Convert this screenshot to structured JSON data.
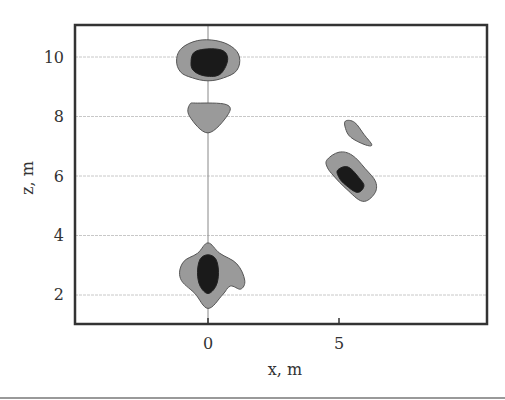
{
  "chart_data": {
    "type": "contour",
    "title": "",
    "xlabel": "x, m",
    "ylabel": "z, m",
    "xlim": [
      -5.1,
      10.7
    ],
    "ylim": [
      1.0,
      11.1
    ],
    "x_ticks": [
      0,
      5
    ],
    "y_ticks": [
      2,
      4,
      6,
      8,
      10
    ],
    "x_tick_labels": [
      "0",
      "5"
    ],
    "y_tick_labels": [
      "2",
      "4",
      "6",
      "8",
      "10"
    ],
    "grid": {
      "horizontal": true,
      "style": "dashed light gray"
    },
    "reference_line": {
      "orientation": "vertical",
      "x": 0
    },
    "legend": null,
    "levels": [
      {
        "name": "outer",
        "color": "#9a9a9a"
      },
      {
        "name": "inner",
        "color": "#1a1a1a"
      }
    ],
    "regions": [
      {
        "id": "top-blob",
        "center": [
          0.0,
          9.85
        ],
        "levels": [
          "outer",
          "inner"
        ],
        "outer": [
          [
            -1.2,
            9.9
          ],
          [
            -1.0,
            10.3
          ],
          [
            -0.4,
            10.55
          ],
          [
            0.3,
            10.55
          ],
          [
            0.9,
            10.35
          ],
          [
            1.2,
            10.0
          ],
          [
            1.1,
            9.55
          ],
          [
            0.6,
            9.3
          ],
          [
            0.0,
            9.2
          ],
          [
            -0.6,
            9.3
          ],
          [
            -1.05,
            9.5
          ]
        ],
        "inner": [
          [
            -0.65,
            9.8
          ],
          [
            -0.45,
            10.2
          ],
          [
            0.45,
            10.25
          ],
          [
            0.75,
            9.95
          ],
          [
            0.5,
            9.45
          ],
          [
            0.0,
            9.35
          ],
          [
            -0.5,
            9.5
          ]
        ]
      },
      {
        "id": "shield-blob",
        "center": [
          0.0,
          8.05
        ],
        "levels": [
          "outer"
        ],
        "outer": [
          [
            -0.7,
            8.4
          ],
          [
            -0.4,
            8.45
          ],
          [
            0.7,
            8.4
          ],
          [
            0.75,
            8.05
          ],
          [
            0.0,
            7.45
          ],
          [
            -0.7,
            8.0
          ]
        ]
      },
      {
        "id": "right-small-blob",
        "center": [
          5.6,
          7.55
        ],
        "levels": [
          "outer"
        ],
        "outer": [
          [
            5.25,
            7.85
          ],
          [
            5.6,
            7.8
          ],
          [
            5.95,
            7.4
          ],
          [
            6.25,
            7.05
          ],
          [
            6.0,
            7.05
          ],
          [
            5.45,
            7.3
          ],
          [
            5.25,
            7.6
          ]
        ]
      },
      {
        "id": "right-large-blob",
        "center": [
          5.5,
          6.0
        ],
        "levels": [
          "outer",
          "inner"
        ],
        "outer": [
          [
            4.55,
            6.55
          ],
          [
            5.0,
            6.8
          ],
          [
            5.5,
            6.7
          ],
          [
            6.0,
            6.25
          ],
          [
            6.4,
            5.8
          ],
          [
            6.35,
            5.4
          ],
          [
            5.9,
            5.15
          ],
          [
            5.3,
            5.55
          ],
          [
            4.8,
            6.0
          ],
          [
            4.55,
            6.3
          ]
        ],
        "inner": [
          [
            4.95,
            6.2
          ],
          [
            5.35,
            6.3
          ],
          [
            5.8,
            5.9
          ],
          [
            5.95,
            5.65
          ],
          [
            5.7,
            5.45
          ],
          [
            5.25,
            5.7
          ],
          [
            5.0,
            5.95
          ]
        ]
      },
      {
        "id": "bottom-blob",
        "center": [
          0.0,
          2.7
        ],
        "levels": [
          "outer",
          "inner"
        ],
        "outer": [
          [
            -1.05,
            2.55
          ],
          [
            -0.95,
            3.1
          ],
          [
            -0.4,
            3.4
          ],
          [
            0.0,
            3.75
          ],
          [
            0.45,
            3.4
          ],
          [
            1.1,
            3.05
          ],
          [
            1.4,
            2.5
          ],
          [
            1.25,
            2.2
          ],
          [
            0.85,
            2.3
          ],
          [
            0.55,
            2.0
          ],
          [
            0.0,
            1.55
          ],
          [
            -0.5,
            2.05
          ]
        ],
        "inner": [
          [
            -0.4,
            2.75
          ],
          [
            -0.3,
            3.2
          ],
          [
            0.0,
            3.35
          ],
          [
            0.3,
            3.2
          ],
          [
            0.4,
            2.75
          ],
          [
            0.3,
            2.3
          ],
          [
            0.0,
            2.05
          ],
          [
            -0.3,
            2.3
          ]
        ]
      }
    ]
  },
  "axes": {
    "x_label": "x, m",
    "y_label": "z, m",
    "x_ticks": [
      "0",
      "5"
    ],
    "y_ticks": [
      "10",
      "8",
      "6",
      "4",
      "2"
    ]
  }
}
